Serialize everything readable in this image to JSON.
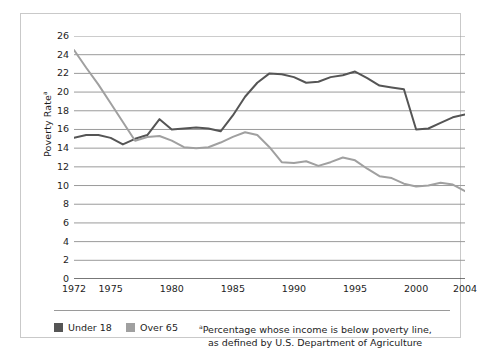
{
  "chart_data": {
    "type": "line",
    "title": "",
    "xlabel": "",
    "ylabel": "Poverty Rate",
    "ylabel_superscript": "a",
    "ylim": [
      0,
      26
    ],
    "ytick_step": 2,
    "yticks": [
      26,
      24,
      22,
      20,
      18,
      16,
      14,
      12,
      10,
      8,
      6,
      4,
      2,
      0
    ],
    "xlim": [
      1972,
      2004
    ],
    "xticks_labeled": [
      1972,
      1975,
      1980,
      1985,
      1990,
      1995,
      2000,
      2004
    ],
    "xticks_all": [
      1972,
      1973,
      1974,
      1975,
      1976,
      1977,
      1978,
      1979,
      1980,
      1981,
      1982,
      1983,
      1984,
      1985,
      1986,
      1987,
      1988,
      1989,
      1990,
      1991,
      1992,
      1993,
      1994,
      1995,
      1996,
      1997,
      1998,
      1999,
      2000,
      2001,
      2002,
      2003,
      2004
    ],
    "grid": true,
    "grid_axis": "y",
    "legend_position": "below-plot",
    "x": [
      1972,
      1973,
      1974,
      1975,
      1976,
      1977,
      1978,
      1979,
      1980,
      1981,
      1982,
      1983,
      1984,
      1985,
      1986,
      1987,
      1988,
      1989,
      1990,
      1991,
      1992,
      1993,
      1994,
      1995,
      1996,
      1997,
      1998,
      1999,
      2000,
      2001,
      2002,
      2003,
      2004
    ],
    "series": [
      {
        "name": "Under 18",
        "color": "#555555",
        "values": [
          15.1,
          15.4,
          15.4,
          15.1,
          14.4,
          15.0,
          15.4,
          17.1,
          16.0,
          16.1,
          16.2,
          16.1,
          15.8,
          17.5,
          19.5,
          21.0,
          22.0,
          21.9,
          21.6,
          21.0,
          21.1,
          21.6,
          21.8,
          22.2,
          21.5,
          20.7,
          20.5,
          20.3,
          16.0,
          16.1,
          16.7,
          17.3,
          17.6
        ]
      },
      {
        "name": "Over 65",
        "color": "#a0a0a0",
        "values": [
          24.5,
          22.6,
          20.8,
          18.8,
          16.8,
          14.8,
          15.2,
          15.3,
          14.8,
          14.1,
          14.0,
          14.1,
          14.6,
          15.2,
          15.7,
          15.4,
          14.1,
          12.5,
          12.4,
          12.6,
          12.1,
          12.5,
          13.0,
          12.7,
          11.8,
          11.0,
          10.8,
          10.2,
          9.9,
          10.0,
          10.3,
          10.1,
          9.4
        ]
      }
    ],
    "note": {
      "marker": "a",
      "line1": "Percentage whose income is below poverty line,",
      "line2": "as defined by U.S. Department of Agriculture"
    }
  },
  "style": {
    "grid_color": "#9a9a9a",
    "frame_color": "#c9c9c9",
    "axis_color": "#6f6f6f",
    "text_color": "#1d1d1d",
    "background": "#ffffff"
  }
}
